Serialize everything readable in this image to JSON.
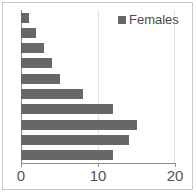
{
  "chart_data": {
    "type": "bar",
    "orientation": "horizontal",
    "title": "",
    "xlabel": "",
    "ylabel": "",
    "categories": [
      "1",
      "2",
      "3",
      "4",
      "5",
      "6",
      "7",
      "8",
      "9",
      "10"
    ],
    "series": [
      {
        "name": "Females",
        "color": "#676767",
        "values": [
          1,
          2,
          3,
          4,
          5,
          8,
          12,
          15,
          14,
          12
        ]
      }
    ],
    "values": [
      1,
      2,
      3,
      4,
      5,
      8,
      12,
      15,
      14,
      12
    ],
    "xlim": [
      0,
      20
    ],
    "xticks": [
      0,
      10,
      20
    ],
    "xtick_labels": [
      "0",
      "10",
      "20"
    ],
    "grid": true,
    "grid_axis": "x",
    "legend": {
      "position": "top-right",
      "entries": [
        {
          "label": "Females",
          "color": "#676767",
          "marker": "square"
        }
      ]
    },
    "axis_color": "#8e8e8e",
    "grid_color": "#e3e3e3",
    "background": "#ffffff"
  },
  "legend": {
    "label": "Females"
  },
  "axis": {
    "tick_labels": [
      "0",
      "10",
      "20"
    ]
  }
}
